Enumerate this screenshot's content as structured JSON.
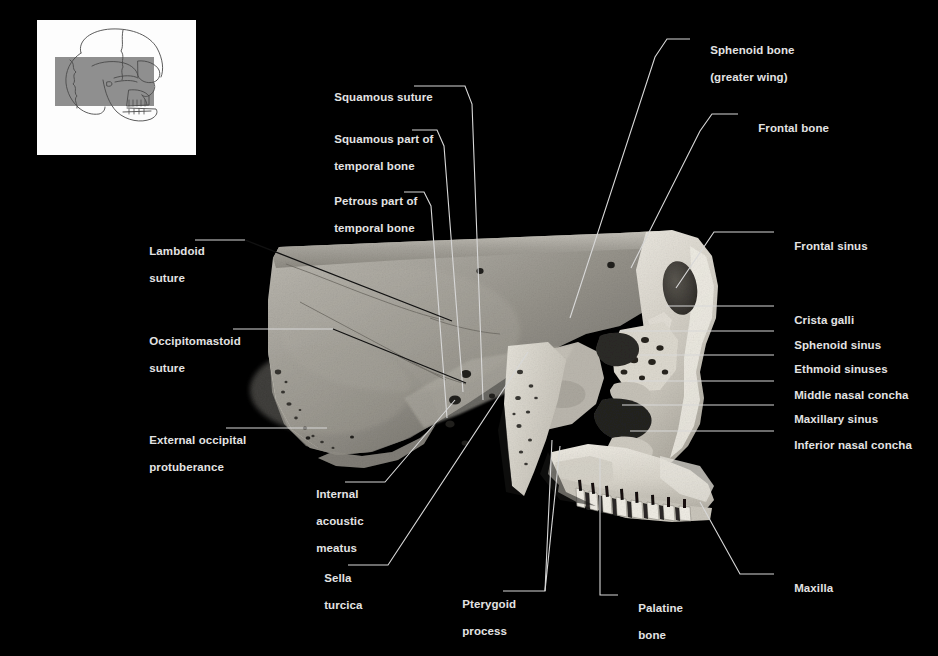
{
  "figure": {
    "type": "anatomical-photograph",
    "background_color": "#000000",
    "label_color": "#e3e3e3",
    "leader_color": "#d8d8d8"
  },
  "thumbnail": {
    "name": "orientation-thumbnail",
    "background": "#fdfdfd",
    "outline_color": "#555555",
    "highlight_color": "#8f8f8f",
    "description": "lateral skull outline with shaded rectangle marking the region shown"
  },
  "labels": [
    {
      "id": "sphenoid-bone-greater-wing",
      "line1": "Sphenoid bone",
      "line2": "(greater wing)",
      "x": 697,
      "y": 36,
      "side": "right"
    },
    {
      "id": "frontal-bone",
      "line1": "Frontal bone",
      "line2": "",
      "x": 745,
      "y": 111,
      "side": "right"
    },
    {
      "id": "squamous-suture",
      "line1": "Squamous suture",
      "line2": "",
      "x": 321,
      "y": 83,
      "side": "left"
    },
    {
      "id": "squamous-part-of-temporal-bone",
      "line1": "Squamous part of",
      "line2": "temporal bone",
      "x": 321,
      "y": 125,
      "side": "left"
    },
    {
      "id": "petrous-part-of-temporal-bone",
      "line1": "Petrous part of",
      "line2": "temporal bone",
      "x": 321,
      "y": 187,
      "side": "left"
    },
    {
      "id": "lambdoid-suture",
      "line1": "Lambdoid",
      "line2": "suture",
      "x": 136,
      "y": 236,
      "side": "left"
    },
    {
      "id": "occipitomastoid-suture",
      "line1": "Occipitomastoid",
      "line2": "suture",
      "x": 136,
      "y": 325,
      "side": "left"
    },
    {
      "id": "external-occipital-protuberance",
      "line1": "External occipital",
      "line2": "protuberance",
      "x": 136,
      "y": 423,
      "side": "left"
    },
    {
      "id": "internal-acoustic-meatus",
      "line1": "Internal",
      "line2": "acoustic",
      "line3": "meatus",
      "x": 303,
      "y": 478,
      "side": "left"
    },
    {
      "id": "sella-turcica",
      "line1": "Sella",
      "line2": "turcica",
      "x": 311,
      "y": 561,
      "side": "left"
    },
    {
      "id": "pterygoid-process",
      "line1": "Pterygoid",
      "line2": "process",
      "x": 449,
      "y": 587,
      "side": "left"
    },
    {
      "id": "palatine-bone",
      "line1": "Palatine",
      "line2": "bone",
      "x": 625,
      "y": 591,
      "side": "right"
    },
    {
      "id": "maxilla",
      "line1": "Maxilla",
      "line2": "",
      "x": 781,
      "y": 570,
      "side": "right"
    },
    {
      "id": "frontal-sinus",
      "line1": "Frontal sinus",
      "line2": "",
      "x": 781,
      "y": 229,
      "side": "right"
    },
    {
      "id": "crista-galli",
      "line1": "Crista galli",
      "line2": "",
      "x": 781,
      "y": 302,
      "side": "right"
    },
    {
      "id": "sphenoid-sinus",
      "line1": "Sphenoid sinus",
      "line2": "",
      "x": 781,
      "y": 327,
      "side": "right"
    },
    {
      "id": "ethmoid-sinuses",
      "line1": "Ethmoid sinuses",
      "line2": "",
      "x": 781,
      "y": 351,
      "side": "right"
    },
    {
      "id": "middle-nasal-concha",
      "line1": "Middle nasal concha",
      "line2": "",
      "x": 781,
      "y": 377,
      "side": "right"
    },
    {
      "id": "maxillary-sinus",
      "line1": "Maxillary sinus",
      "line2": "",
      "x": 781,
      "y": 401,
      "side": "right"
    },
    {
      "id": "inferior-nasal-concha",
      "line1": "Inferior nasal concha",
      "line2": "",
      "x": 781,
      "y": 427,
      "side": "right"
    }
  ]
}
